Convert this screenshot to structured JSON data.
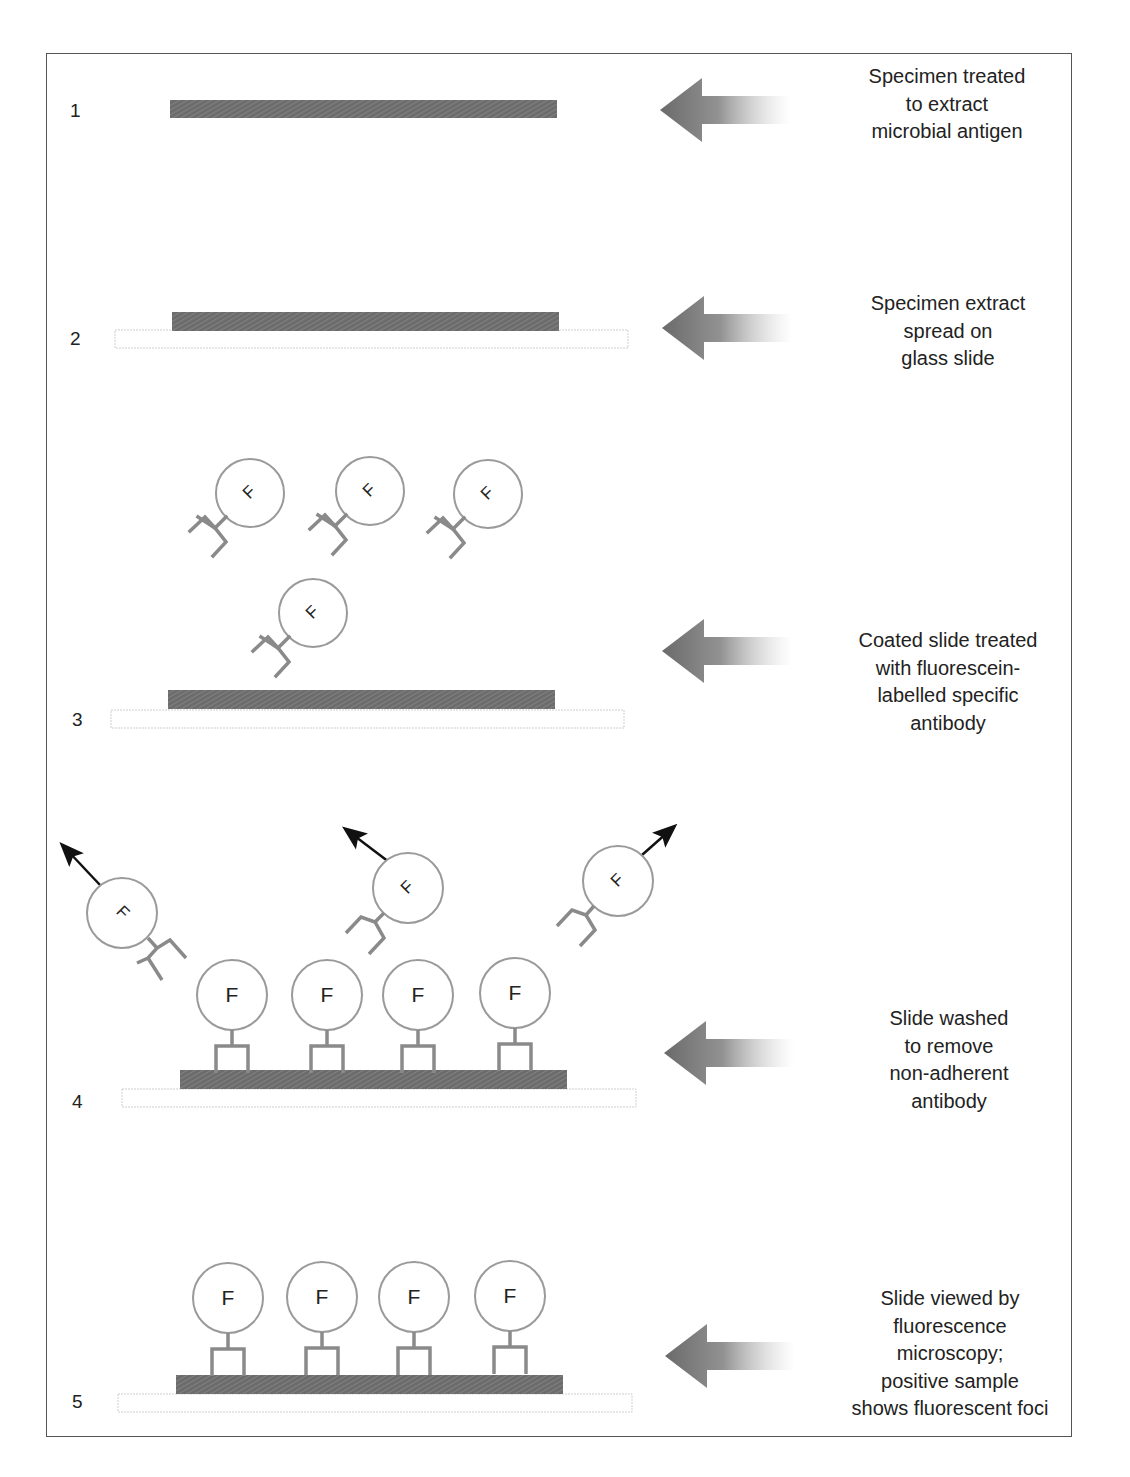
{
  "figure": {
    "steps": [
      {
        "number": "1",
        "caption_lines": [
          "Specimen treated",
          "to extract",
          "microbial antigen"
        ]
      },
      {
        "number": "2",
        "caption_lines": [
          "Specimen extract",
          "spread on",
          "glass slide"
        ]
      },
      {
        "number": "3",
        "caption_lines": [
          "Coated slide treated",
          "with fluorescein-",
          "labelled specific",
          "antibody"
        ]
      },
      {
        "number": "4",
        "caption_lines": [
          "Slide washed",
          "to remove",
          "non-adherent",
          "antibody"
        ]
      },
      {
        "number": "5",
        "caption_lines": [
          "Slide viewed by",
          "fluorescence",
          "microscopy;",
          "positive sample",
          "shows fluorescent foci"
        ]
      }
    ],
    "fluorescein_label": "F",
    "colors": {
      "antigen_bar": "#707070",
      "antibody_stroke": "#8a8a8a",
      "circle_stroke": "#9a9a9a",
      "slide_stroke": "#c8c8c8",
      "arrow_dark": "#6e6e6e",
      "wash_arrow": "#111111",
      "text": "#222222",
      "frame": "#555555"
    }
  }
}
